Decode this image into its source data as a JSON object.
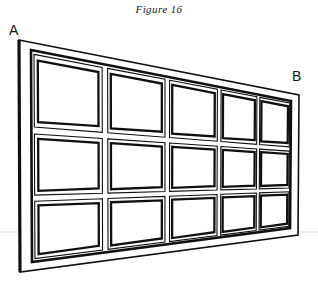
{
  "figure": {
    "caption": "Figure 16",
    "labels": {
      "left_corner": "A",
      "right_corner": "B"
    },
    "colors": {
      "ink": "#101010",
      "background": "#ffffff",
      "faint_line": "#d9d9d9"
    },
    "geometry": {
      "description": "perspective line drawing of a paneled gate receding to the right",
      "panel_columns": 5,
      "panel_rows": 3,
      "outer_frame": {
        "top_left": [
          19,
          40
        ],
        "top_right": [
          299,
          95
        ],
        "bottom_right": [
          298,
          235
        ],
        "bottom_left": [
          20,
          272
        ]
      },
      "inner_frame": {
        "top_left": [
          31,
          50
        ],
        "top_right": [
          291,
          101
        ],
        "bottom_right": [
          290,
          228
        ],
        "bottom_left": [
          32,
          262
        ]
      },
      "column_x_fractions": [
        0.0,
        0.285,
        0.525,
        0.725,
        0.875,
        1.0
      ],
      "row_y_fractions": [
        0.0,
        0.38,
        0.7,
        1.0
      ],
      "panel_gap": 0.035,
      "faint_scan_line_y": 232
    }
  }
}
